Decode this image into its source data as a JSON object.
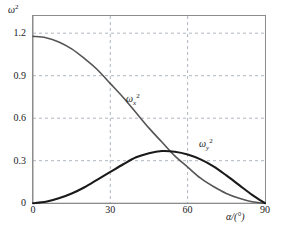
{
  "chart_data": {
    "type": "line",
    "title": "",
    "subtitle": "",
    "xlabel": "α/(°)",
    "ylabel": "ω²",
    "xlim": [
      0,
      90
    ],
    "ylim": [
      0,
      1.35
    ],
    "grid": true,
    "grid_style": "dashed",
    "legend": "inline-curve-labels",
    "x_ticks": [
      "0",
      "30",
      "60",
      "90"
    ],
    "x_tick_values": [
      0,
      30,
      60,
      90
    ],
    "y_ticks": [
      "0",
      "0.3",
      "0.6",
      "0.9",
      "1.2"
    ],
    "y_tick_values": [
      0,
      0.3,
      0.6,
      0.9,
      1.2
    ],
    "series": [
      {
        "name": "ωx²",
        "label_omega": "ω",
        "label_sub": "x",
        "label_sup": "2",
        "color": "#555555",
        "x": [
          0,
          5,
          10,
          15,
          20,
          25,
          30,
          35,
          40,
          45,
          50,
          55,
          60,
          65,
          70,
          75,
          80,
          85,
          90
        ],
        "values": [
          1.2,
          1.19,
          1.16,
          1.11,
          1.04,
          0.96,
          0.86,
          0.76,
          0.65,
          0.54,
          0.44,
          0.34,
          0.26,
          0.18,
          0.12,
          0.07,
          0.035,
          0.01,
          0.0
        ]
      },
      {
        "name": "ωy²",
        "label_omega": "ω",
        "label_sub": "y",
        "label_sup": "2",
        "color": "#1a1a1a",
        "x": [
          0,
          5,
          10,
          15,
          20,
          25,
          30,
          35,
          40,
          45,
          50,
          55,
          60,
          65,
          70,
          75,
          80,
          85,
          90
        ],
        "values": [
          0.0,
          0.01,
          0.035,
          0.07,
          0.115,
          0.17,
          0.225,
          0.28,
          0.33,
          0.36,
          0.375,
          0.37,
          0.35,
          0.315,
          0.265,
          0.2,
          0.13,
          0.06,
          0.0
        ]
      }
    ],
    "annotations": [
      {
        "text": "ωx²",
        "x": 33,
        "y": 0.72
      },
      {
        "text": "ωy²",
        "x": 67,
        "y": 0.44
      }
    ]
  },
  "axes": {
    "y_title_omega": "ω",
    "y_title_sup": "2",
    "x_title": "α/(°)"
  },
  "y_tick_labels": {
    "t0": "0",
    "t1": "0.3",
    "t2": "0.6",
    "t3": "0.9",
    "t4": "1.2"
  },
  "x_tick_labels": {
    "t0": "0",
    "t1": "30",
    "t2": "60",
    "t3": "90"
  },
  "curve_labels": {
    "omega_x": {
      "omega": "ω",
      "sub": "x",
      "sup": "2"
    },
    "omega_y": {
      "omega": "ω",
      "sub": "y",
      "sup": "2"
    }
  }
}
